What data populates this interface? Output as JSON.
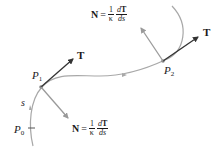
{
  "diagram": {
    "colors": {
      "curve": "#a8a8a8",
      "tangent_arrow": "#333333",
      "normal_arrow": "#9a9a9a",
      "text": "#1a1a1a"
    },
    "points": {
      "p0": {
        "label": "P",
        "sub": "0"
      },
      "p1": {
        "label": "P",
        "sub": "1"
      },
      "p2": {
        "label": "P",
        "sub": "2"
      }
    },
    "arc_length_label": "s",
    "tangent_label": "T",
    "normal_eq": {
      "lhs": "N",
      "equals": "=",
      "one": "1",
      "kappa": "κ",
      "dT_d": "d",
      "dT_T": "T",
      "ds": "ds"
    }
  }
}
